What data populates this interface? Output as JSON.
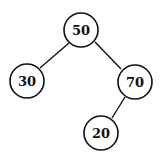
{
  "tree": {
    "nodes": [
      {
        "id": "n50",
        "label": "50",
        "cx": 81,
        "cy": 30
      },
      {
        "id": "n30",
        "label": "30",
        "cx": 27,
        "cy": 81
      },
      {
        "id": "n70",
        "label": "70",
        "cx": 135,
        "cy": 82
      },
      {
        "id": "n20",
        "label": "20",
        "cx": 101,
        "cy": 133
      }
    ],
    "edges": [
      {
        "from": "n50",
        "to": "n30"
      },
      {
        "from": "n50",
        "to": "n70"
      },
      {
        "from": "n70",
        "to": "n20"
      }
    ]
  }
}
